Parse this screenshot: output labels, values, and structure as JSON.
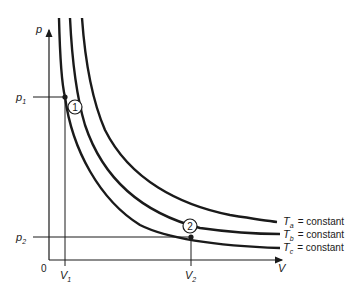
{
  "diagram": {
    "axes": {
      "y_label": "p",
      "x_label": "V",
      "origin_label": "0"
    },
    "ticks": {
      "p1": {
        "base": "p",
        "sub": "1"
      },
      "p2": {
        "base": "p",
        "sub": "2"
      },
      "V1": {
        "base": "V",
        "sub": "1"
      },
      "V2": {
        "base": "V",
        "sub": "2"
      }
    },
    "points": [
      {
        "id": "1",
        "label": "1"
      },
      {
        "id": "2",
        "label": "2"
      }
    ],
    "curves": [
      {
        "name": "Ta",
        "base": "T",
        "sub": "a",
        "suffix": "= constant"
      },
      {
        "name": "Tb",
        "base": "T",
        "sub": "b",
        "suffix": "= constant"
      },
      {
        "name": "Tc",
        "base": "T",
        "sub": "c",
        "suffix": "= constant"
      }
    ],
    "colors": {
      "ink": "#1a1a1a",
      "background": "#ffffff"
    }
  }
}
